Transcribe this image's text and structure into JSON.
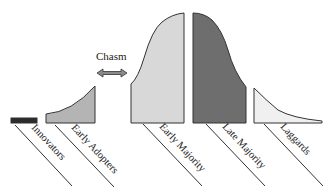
{
  "diagram": {
    "chasm_label": "Chasm",
    "segments": [
      {
        "id": "innovators",
        "label": "Innovators",
        "fill": "#2b2b2b"
      },
      {
        "id": "early-adopters",
        "label": "Early Adopters",
        "fill": "#b4b4b4"
      },
      {
        "id": "early-majority",
        "label": "Early Majority",
        "fill": "#d8d8d8"
      },
      {
        "id": "late-majority",
        "label": "Late Majority",
        "fill": "#6e6e6e"
      },
      {
        "id": "laggards",
        "label": "Laggards",
        "fill": "#f0f0f0"
      }
    ],
    "colors": {
      "outline": "#333333",
      "arrow": "#8a8a8a"
    }
  }
}
